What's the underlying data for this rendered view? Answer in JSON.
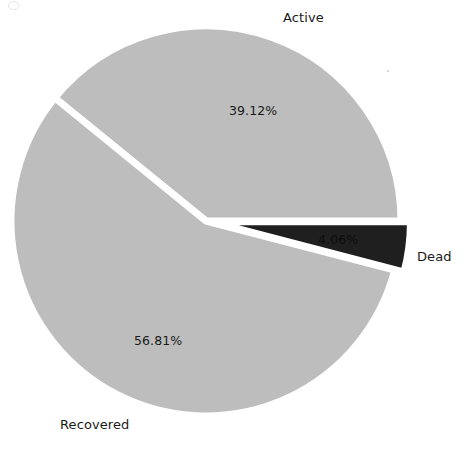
{
  "chart_data": {
    "type": "pie",
    "title": "",
    "categories": [
      "Active",
      "Dead",
      "Recovered"
    ],
    "values": [
      39.12,
      4.06,
      56.81
    ],
    "value_labels": [
      "39.12%",
      "4.06%",
      "56.81%"
    ],
    "units": "percent",
    "legend": "none",
    "labels_position": "outside-category-inside-percent",
    "exploded_slices": [
      "Dead"
    ],
    "slice_colors": [
      "#bdbdbd",
      "#1f1f1f",
      "#bdbdbd"
    ],
    "separator_color": "#ffffff",
    "background": "#ffffff",
    "start_angle_deg": 0,
    "direction": "clockwise",
    "xlabel": "",
    "ylabel": ""
  },
  "chart": {
    "slices": [
      {
        "name": "Active",
        "label": "Active",
        "percent_label": "39.12%",
        "value": 39.12,
        "color": "#bdbdbd"
      },
      {
        "name": "Dead",
        "label": "Dead",
        "percent_label": "4.06%",
        "value": 4.06,
        "color": "#1f1f1f"
      },
      {
        "name": "Recovered",
        "label": "Recovered",
        "percent_label": "56.81%",
        "value": 56.81,
        "color": "#bdbdbd"
      }
    ]
  }
}
